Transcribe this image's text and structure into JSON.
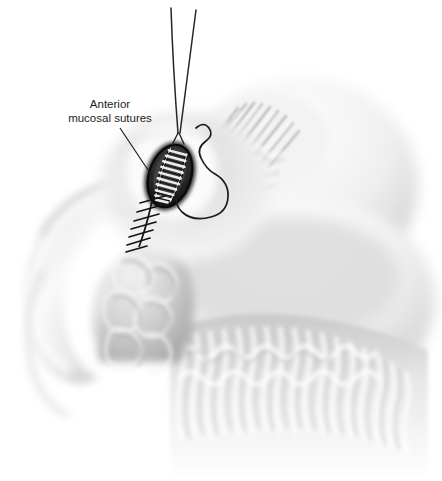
{
  "figure": {
    "type": "medical-illustration",
    "background_color": "#ffffff",
    "width": 442,
    "height": 481
  },
  "labels": {
    "anterior_mucosal_sutures": {
      "line1": "Anterior",
      "line2": "mucosal sutures",
      "full_text": "Anterior mucosal sutures",
      "text_color": "#1d1d1d",
      "leader_line": {
        "from_x": 120,
        "from_y": 128,
        "to_x": 152,
        "to_y": 176,
        "color": "#222222"
      }
    }
  },
  "anatomy": {
    "bowel_loop_left": {
      "name": "bowel-loop",
      "fill_light": "#fdfdfd",
      "fill_mid": "#d8d8d8",
      "fill_dark": "#9a9a9a"
    },
    "lobulated_mass": {
      "name": "lobulated-mass",
      "fill_light": "#efefef",
      "fill_mid": "#c9c9c9",
      "fill_dark": "#a5a5a5"
    },
    "mucosal_folds_upper_right": {
      "name": "mucosal-folds",
      "fill_light": "#f6f6f6",
      "fill_mid": "#cfcfcf"
    },
    "villous_mucosa_lower_right": {
      "name": "villous-mucosa",
      "fill_light": "#fafafa",
      "fill_mid": "#d5d5d5"
    }
  },
  "surgical": {
    "wound_opening": {
      "name": "anastomosis-opening",
      "center_x": 170,
      "center_y": 176,
      "rx": 22,
      "ry": 33,
      "rotation_deg": 18,
      "rim_color": "#1a1a1a",
      "interior_color": "#3a3a3a"
    },
    "running_suture_ladder": {
      "name": "running-suture-ladder",
      "rung_count": 10,
      "thread_color": "#f0f0f0",
      "edge_color": "#101010"
    },
    "descending_suture_line": {
      "name": "descending-suture-line",
      "stitch_count": 7,
      "thread_color": "#141414",
      "start_x": 153,
      "start_y": 196,
      "end_x": 139,
      "end_y": 247
    },
    "free_suture_loop": {
      "name": "free-suture-loop",
      "thread_color": "#1b1b1b",
      "stroke_width": 1.6
    },
    "suture_tails_top": {
      "name": "suture-tails",
      "count": 2,
      "thread_color": "#262626",
      "top_y": 8,
      "converge_x": 178,
      "converge_y": 133
    }
  }
}
